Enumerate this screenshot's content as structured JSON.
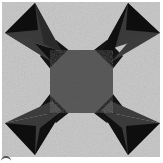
{
  "image": {
    "subject": "quilt block",
    "pattern": "four-pointed star / X block with central octagon",
    "width": 163,
    "height": 163
  },
  "colors": {
    "background": "#cbcbcb",
    "background_speckle": "#e2e2e2",
    "arm_outer": "#101010",
    "arm_inner": "#3c3c3c",
    "center": "#5c5c5c",
    "center_shadow": "#4a4a4a"
  },
  "shapes": {
    "arms": [
      {
        "name": "top-left",
        "tip": [
          20,
          18
        ],
        "left": [
          5,
          33
        ],
        "right": [
          35,
          3
        ],
        "inner": [
          58,
          58
        ]
      },
      {
        "name": "top-right",
        "tip": [
          143,
          18
        ],
        "left": [
          128,
          3
        ],
        "right": [
          160,
          33
        ],
        "inner": [
          105,
          58
        ]
      },
      {
        "name": "bottom-left",
        "tip": [
          20,
          139
        ],
        "left": [
          5,
          123
        ],
        "right": [
          35,
          155
        ],
        "inner": [
          58,
          103
        ]
      },
      {
        "name": "bottom-right",
        "tip": [
          143,
          139
        ],
        "left": [
          160,
          123
        ],
        "right": [
          128,
          155
        ],
        "inner": [
          105,
          103
        ]
      }
    ],
    "center_octagon": [
      [
        68,
        50
      ],
      [
        95,
        50
      ],
      [
        113,
        68
      ],
      [
        113,
        95
      ],
      [
        95,
        113
      ],
      [
        68,
        113
      ],
      [
        50,
        95
      ],
      [
        50,
        68
      ]
    ]
  }
}
